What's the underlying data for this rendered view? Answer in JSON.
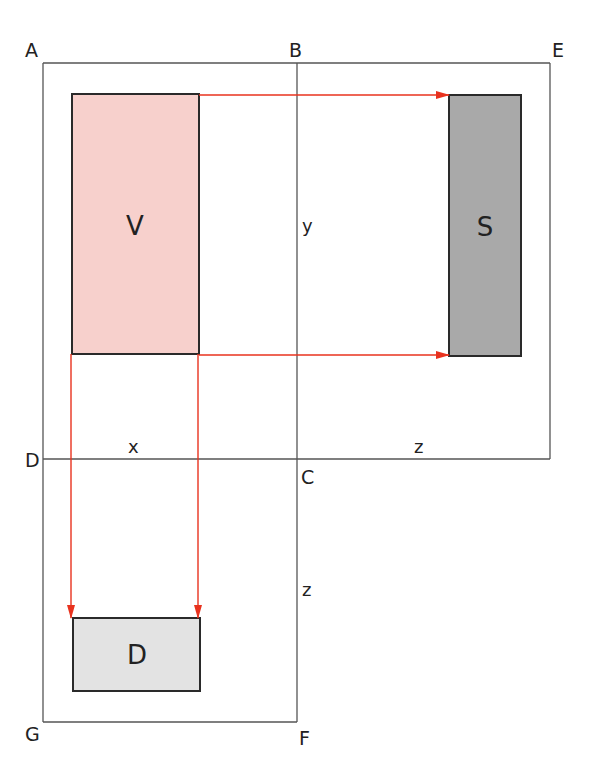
{
  "diagram": {
    "corners": {
      "A": "A",
      "B": "B",
      "E": "E",
      "D": "D",
      "C": "C",
      "G": "G",
      "F": "F"
    },
    "dimensions": {
      "x": "x",
      "y": "y",
      "z_right": "z",
      "z_bottom": "z"
    },
    "views": [
      {
        "id": "V",
        "label": "V",
        "fill": "#f7d0cc",
        "x": 72,
        "y": 94,
        "w": 127,
        "h": 260
      },
      {
        "id": "S",
        "label": "S",
        "fill": "#a9a9a9",
        "x": 449,
        "y": 95,
        "w": 72,
        "h": 261
      },
      {
        "id": "D",
        "label": "D",
        "fill": "#e3e3e3",
        "x": 73,
        "y": 618,
        "w": 127,
        "h": 73
      }
    ],
    "colors": {
      "frame_line": "#555555",
      "box_border": "#2a2a2a",
      "projection_arrow": "#e8321e",
      "text": "#222222"
    },
    "projection_arrows": [
      {
        "from": "V-top-right",
        "to": "S-top-left",
        "direction": "right"
      },
      {
        "from": "V-bottom-right",
        "to": "S-bottom-left",
        "direction": "right"
      },
      {
        "from": "V-bottom-left",
        "to": "D-top-left",
        "direction": "down"
      },
      {
        "from": "V-bottom-right",
        "to": "D-top-right",
        "direction": "down"
      }
    ]
  }
}
